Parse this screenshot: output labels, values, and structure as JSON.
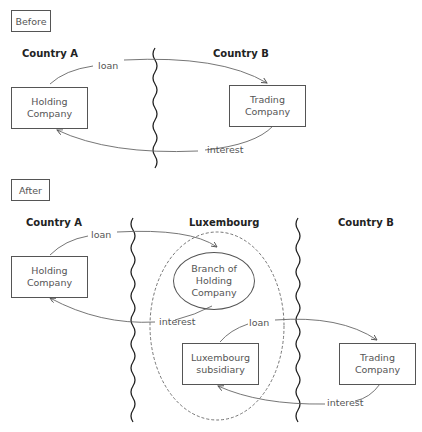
{
  "before": {
    "tag": "Before",
    "country_a": "Country A",
    "country_b": "Country B",
    "holding_company": "Holding\nCompany",
    "holding_l1": "Holding",
    "holding_l2": "Company",
    "trading_l1": "Trading",
    "trading_l2": "Company",
    "loan": "loan",
    "interest": "interest"
  },
  "after": {
    "tag": "After",
    "country_a": "Country A",
    "luxembourg": "Luxembourg",
    "country_b": "Country B",
    "holding_l1": "Holding",
    "holding_l2": "Company",
    "branch_l1": "Branch of",
    "branch_l2": "Holding",
    "branch_l3": "Company",
    "subsidiary_l1": "Luxembourg",
    "subsidiary_l2": "subsidiary",
    "trading_l1": "Trading",
    "trading_l2": "Company",
    "loan_1": "loan",
    "interest_1": "interest",
    "loan_2": "loan",
    "interest_2": "interest"
  },
  "colors": {
    "line": "#555555",
    "border": "#555555",
    "dashed": "#666666"
  }
}
